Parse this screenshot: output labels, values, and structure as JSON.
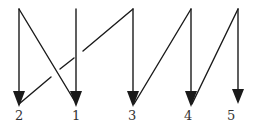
{
  "diagram": {
    "stroke_color": "#1a1a1a",
    "label_color": "#333333",
    "arrows": [
      {
        "id": "arrow-2",
        "label": "2",
        "x": 19,
        "y_top": 9,
        "y_tip": 106
      },
      {
        "id": "arrow-1",
        "label": "1",
        "x": 76,
        "y_top": 9,
        "y_tip": 106
      },
      {
        "id": "arrow-3",
        "label": "3",
        "x": 133,
        "y_top": 9,
        "y_tip": 106
      },
      {
        "id": "arrow-4",
        "label": "4",
        "x": 191,
        "y_top": 9,
        "y_tip": 106
      },
      {
        "id": "arrow-5",
        "label": "5",
        "x": 238,
        "y_top": 9,
        "y_tip": 104
      }
    ],
    "connectors": [
      {
        "from": "top of 2",
        "to": "tip of 1"
      },
      {
        "from": "tip of 2",
        "to": "top of 3",
        "broken_at_crossing": true
      },
      {
        "from": "tip of 3",
        "to": "top of 4"
      },
      {
        "from": "tip of 4",
        "to": "top of 5"
      }
    ],
    "labels": [
      "2",
      "1",
      "3",
      "4",
      "5"
    ]
  }
}
